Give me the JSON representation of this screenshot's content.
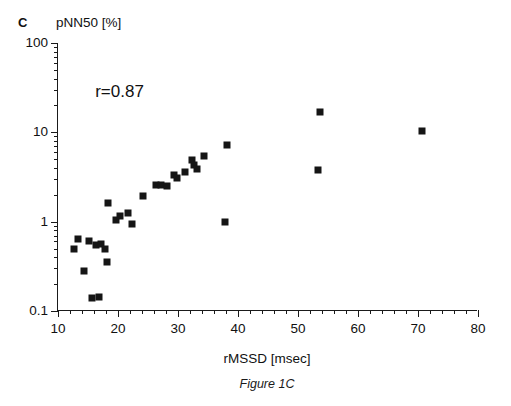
{
  "figure": {
    "panel_letter": "C",
    "caption": "Figure 1C"
  },
  "chart_data": {
    "type": "scatter",
    "title": "",
    "xlabel": "rMSSD [msec]",
    "ylabel": "pNN50 [%]",
    "xscale": "linear",
    "yscale": "log",
    "xlim": [
      10,
      80
    ],
    "ylim": [
      0.1,
      100
    ],
    "grid": false,
    "legend": null,
    "xticks": [
      10,
      20,
      30,
      40,
      50,
      60,
      70,
      80
    ],
    "xtick_labels": [
      "10",
      "20",
      "30",
      "40",
      "50",
      "60",
      "70",
      "80"
    ],
    "xminor_step": 2,
    "yticks": [
      0.1,
      1,
      10,
      100
    ],
    "ytick_labels": [
      "0.1",
      "1",
      "10",
      "100"
    ],
    "annotations": [
      {
        "text": "r=0.87",
        "x": 16.2,
        "y": 36
      }
    ],
    "marker": {
      "shape": "square",
      "color": "#151515",
      "size": 7
    },
    "points": [
      {
        "x": 12.6,
        "y": 0.5
      },
      {
        "x": 13.4,
        "y": 0.64
      },
      {
        "x": 14.3,
        "y": 0.28
      },
      {
        "x": 15.2,
        "y": 0.6
      },
      {
        "x": 15.6,
        "y": 0.14
      },
      {
        "x": 16.4,
        "y": 0.55
      },
      {
        "x": 16.9,
        "y": 0.145
      },
      {
        "x": 17.1,
        "y": 0.56
      },
      {
        "x": 17.8,
        "y": 0.5
      },
      {
        "x": 18.1,
        "y": 0.35
      },
      {
        "x": 18.3,
        "y": 1.6
      },
      {
        "x": 19.6,
        "y": 1.05
      },
      {
        "x": 20.4,
        "y": 1.15
      },
      {
        "x": 21.6,
        "y": 1.25
      },
      {
        "x": 22.3,
        "y": 0.95
      },
      {
        "x": 24.1,
        "y": 1.95
      },
      {
        "x": 26.4,
        "y": 2.6
      },
      {
        "x": 27.2,
        "y": 2.55
      },
      {
        "x": 28.1,
        "y": 2.5
      },
      {
        "x": 29.3,
        "y": 3.3
      },
      {
        "x": 29.8,
        "y": 3.05
      },
      {
        "x": 31.1,
        "y": 3.6
      },
      {
        "x": 32.4,
        "y": 4.9
      },
      {
        "x": 32.6,
        "y": 4.3
      },
      {
        "x": 33.1,
        "y": 3.9
      },
      {
        "x": 34.4,
        "y": 5.4
      },
      {
        "x": 37.9,
        "y": 0.98
      },
      {
        "x": 38.2,
        "y": 7.3
      },
      {
        "x": 53.6,
        "y": 17.0
      },
      {
        "x": 53.4,
        "y": 3.8
      },
      {
        "x": 70.6,
        "y": 10.3
      }
    ]
  }
}
